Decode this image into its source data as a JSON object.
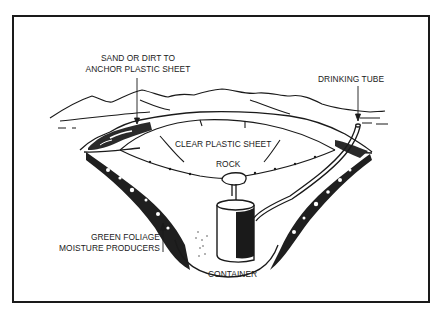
{
  "figure": {
    "type": "solar still diagram",
    "frame": {
      "border_color": "#1a1a1a",
      "background": "#ffffff"
    },
    "labels": {
      "sand_anchor": {
        "line1": "SAND OR DIRT TO",
        "line2": "ANCHOR PLASTIC SHEET"
      },
      "drinking_tube": "DRINKING TUBE",
      "plastic_sheet": "CLEAR PLASTIC SHEET",
      "rock": "ROCK",
      "foliage": {
        "line1": "GREEN FOLIAGE",
        "line2": "MOISTURE PRODUCERS"
      },
      "container": "CONTAINER"
    }
  }
}
